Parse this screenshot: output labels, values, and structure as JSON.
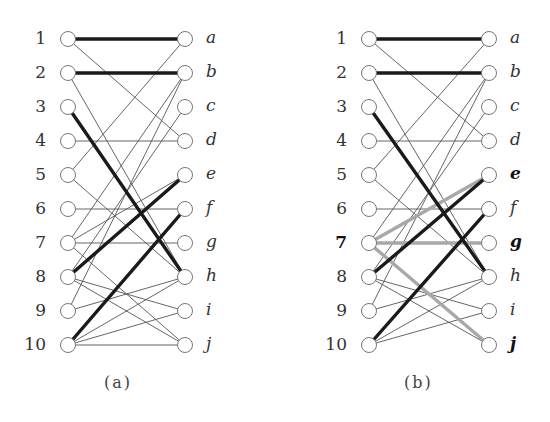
{
  "figure": {
    "layout": {
      "row_start_y": 39,
      "row_step": 34,
      "node_radius": 7.5,
      "colors": {
        "thin_edge": "#555555",
        "thick_edge": "#1a1a1a",
        "highlight_edge": "#a8a8a8",
        "node_stroke": "#777777",
        "node_fill": "#ffffff"
      }
    },
    "panels": [
      {
        "id": "a",
        "caption": "(a)",
        "caption_x": 104,
        "left_x": 68,
        "right_x": 185,
        "left_label_x": 16,
        "right_label_x": 206,
        "left_nodes": [
          "1",
          "2",
          "3",
          "4",
          "5",
          "6",
          "7",
          "8",
          "9",
          "10"
        ],
        "right_nodes": [
          "a",
          "b",
          "c",
          "d",
          "e",
          "f",
          "g",
          "h",
          "i",
          "j"
        ],
        "bold_left": [],
        "bold_right": [],
        "edges": [
          {
            "from": "1",
            "to": "a",
            "style": "thick"
          },
          {
            "from": "1",
            "to": "d",
            "style": "thin"
          },
          {
            "from": "2",
            "to": "b",
            "style": "thick"
          },
          {
            "from": "2",
            "to": "h",
            "style": "thin"
          },
          {
            "from": "3",
            "to": "h",
            "style": "thick"
          },
          {
            "from": "4",
            "to": "d",
            "style": "thin"
          },
          {
            "from": "5",
            "to": "a",
            "style": "thin"
          },
          {
            "from": "5",
            "to": "h",
            "style": "thin"
          },
          {
            "from": "6",
            "to": "f",
            "style": "thin"
          },
          {
            "from": "7",
            "to": "b",
            "style": "thin"
          },
          {
            "from": "7",
            "to": "e",
            "style": "thin"
          },
          {
            "from": "7",
            "to": "g",
            "style": "thin"
          },
          {
            "from": "7",
            "to": "j",
            "style": "thin"
          },
          {
            "from": "8",
            "to": "c",
            "style": "thin"
          },
          {
            "from": "8",
            "to": "e",
            "style": "thick"
          },
          {
            "from": "8",
            "to": "i",
            "style": "thin"
          },
          {
            "from": "8",
            "to": "j",
            "style": "thin"
          },
          {
            "from": "9",
            "to": "b",
            "style": "thin"
          },
          {
            "from": "9",
            "to": "h",
            "style": "thin"
          },
          {
            "from": "10",
            "to": "f",
            "style": "thick"
          },
          {
            "from": "10",
            "to": "h",
            "style": "thin"
          },
          {
            "from": "10",
            "to": "i",
            "style": "thin"
          },
          {
            "from": "10",
            "to": "j",
            "style": "thin"
          }
        ]
      },
      {
        "id": "b",
        "caption": "(b)",
        "caption_x": 404,
        "left_x": 369,
        "right_x": 489,
        "left_label_x": 317,
        "right_label_x": 510,
        "left_nodes": [
          "1",
          "2",
          "3",
          "4",
          "5",
          "6",
          "7",
          "8",
          "9",
          "10"
        ],
        "right_nodes": [
          "a",
          "b",
          "c",
          "d",
          "e",
          "f",
          "g",
          "h",
          "i",
          "j"
        ],
        "bold_left": [
          "7"
        ],
        "bold_right": [
          "e",
          "g",
          "j"
        ],
        "edges": [
          {
            "from": "1",
            "to": "a",
            "style": "thick"
          },
          {
            "from": "1",
            "to": "d",
            "style": "thin"
          },
          {
            "from": "2",
            "to": "b",
            "style": "thick"
          },
          {
            "from": "2",
            "to": "h",
            "style": "thin"
          },
          {
            "from": "3",
            "to": "h",
            "style": "thick"
          },
          {
            "from": "4",
            "to": "d",
            "style": "thin"
          },
          {
            "from": "5",
            "to": "a",
            "style": "thin"
          },
          {
            "from": "5",
            "to": "h",
            "style": "thin"
          },
          {
            "from": "6",
            "to": "f",
            "style": "thin"
          },
          {
            "from": "7",
            "to": "b",
            "style": "thin"
          },
          {
            "from": "7",
            "to": "e",
            "style": "highlight"
          },
          {
            "from": "7",
            "to": "g",
            "style": "highlight"
          },
          {
            "from": "7",
            "to": "j",
            "style": "highlight"
          },
          {
            "from": "8",
            "to": "c",
            "style": "thin"
          },
          {
            "from": "8",
            "to": "e",
            "style": "thick"
          },
          {
            "from": "8",
            "to": "i",
            "style": "thin"
          },
          {
            "from": "8",
            "to": "j",
            "style": "thin"
          },
          {
            "from": "9",
            "to": "b",
            "style": "thin"
          },
          {
            "from": "9",
            "to": "h",
            "style": "thin"
          },
          {
            "from": "10",
            "to": "f",
            "style": "thick"
          },
          {
            "from": "10",
            "to": "h",
            "style": "thin"
          },
          {
            "from": "10",
            "to": "i",
            "style": "thin"
          }
        ]
      }
    ]
  }
}
